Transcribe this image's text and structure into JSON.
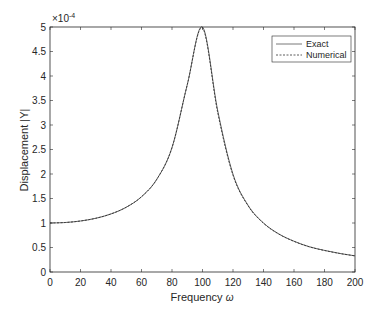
{
  "chart_data": {
    "type": "line",
    "title": "",
    "xlabel": "Frequency ω",
    "xlabel_text": "Frequency",
    "xlabel_symbol": "ω",
    "ylabel": "Displacement |Y|",
    "y_exponent_label": "×10",
    "y_exponent": "-4",
    "xlim": [
      0,
      200
    ],
    "ylim": [
      0,
      5
    ],
    "y_scale_factor": 0.0001,
    "grid": false,
    "legend_position": "top-right",
    "x_ticks": [
      "0",
      "20",
      "40",
      "60",
      "80",
      "100",
      "120",
      "140",
      "160",
      "180",
      "200"
    ],
    "y_ticks": [
      "0",
      "0.5",
      "1",
      "1.5",
      "2",
      "2.5",
      "3",
      "3.5",
      "4",
      "4.5",
      "5"
    ],
    "x": [
      0,
      10,
      20,
      30,
      40,
      50,
      60,
      70,
      80,
      90,
      100,
      110,
      120,
      130,
      140,
      150,
      160,
      170,
      180,
      190,
      200
    ],
    "series": [
      {
        "name": "Exact",
        "style": "solid",
        "values": [
          1.0,
          1.01,
          1.041,
          1.096,
          1.185,
          1.322,
          1.536,
          1.891,
          2.539,
          3.821,
          5.0,
          3.288,
          1.995,
          1.356,
          1.0,
          0.778,
          0.628,
          0.516,
          0.441,
          0.379,
          0.33
        ]
      },
      {
        "name": "Numerical",
        "style": "dashed",
        "values": [
          1.0,
          1.01,
          1.041,
          1.096,
          1.185,
          1.322,
          1.536,
          1.891,
          2.539,
          3.821,
          4.98,
          3.25,
          1.975,
          1.345,
          0.995,
          0.774,
          0.625,
          0.514,
          0.439,
          0.378,
          0.329
        ]
      }
    ]
  }
}
